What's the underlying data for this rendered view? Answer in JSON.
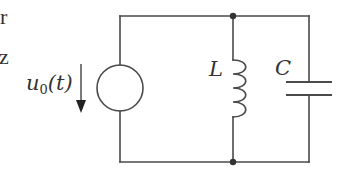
{
  "diagram": {
    "type": "circuit-schematic",
    "title": "",
    "cropped_text_fragments": [
      "r",
      "z"
    ],
    "colors": {
      "background": "#ffffff",
      "wire": "#4a4a4a",
      "text": "#333333"
    },
    "components": [
      {
        "id": "source",
        "kind": "voltage-source",
        "label_main": "u",
        "label_sub": "0",
        "label_arg": "(t)",
        "direction": "down"
      },
      {
        "id": "inductor",
        "kind": "inductor",
        "label": "L"
      },
      {
        "id": "capacitor",
        "kind": "capacitor",
        "label": "C"
      }
    ],
    "nodes": [
      {
        "id": "top-junction",
        "kind": "junction-dot"
      },
      {
        "id": "bottom-junction",
        "kind": "junction-dot"
      }
    ],
    "connection": "source in parallel with L and C"
  }
}
